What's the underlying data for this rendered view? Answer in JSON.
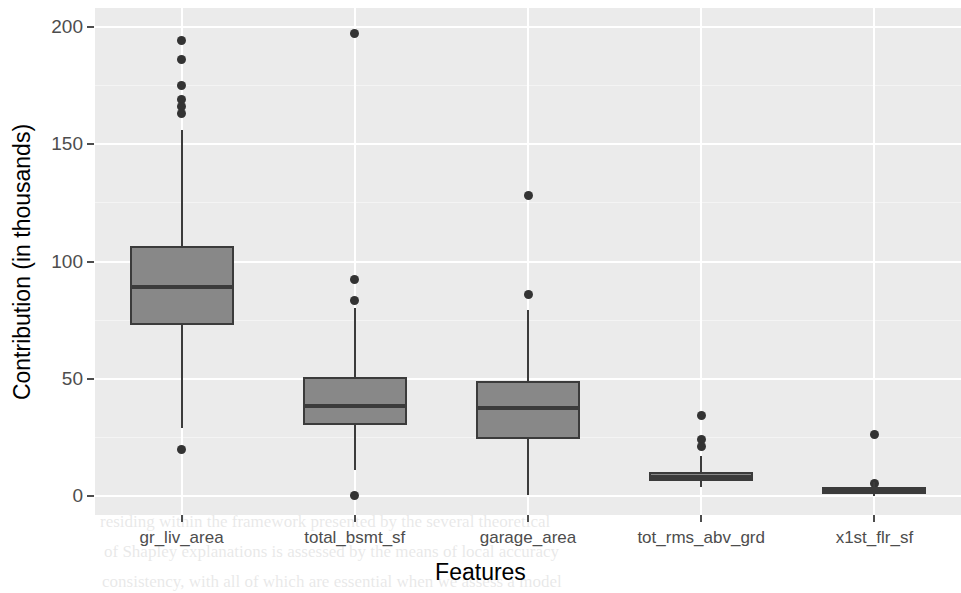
{
  "chart_data": {
    "type": "box",
    "title": "",
    "xlabel": "Features",
    "ylabel": "Contribution (in thousands)",
    "ylim": [
      -8,
      208
    ],
    "yticks": [
      0,
      50,
      100,
      150,
      200
    ],
    "ytick_labels": [
      "0",
      "50",
      "100",
      "150",
      "200"
    ],
    "yminor": [
      25,
      75,
      125,
      175
    ],
    "grid": "horizontal-and-vertical-major",
    "legend": "none",
    "categories": [
      "gr_liv_area",
      "total_bsmt_sf",
      "garage_area",
      "tot_rms_abv_grd",
      "x1st_flr_sf"
    ],
    "boxes": [
      {
        "name": "gr_liv_area",
        "whisker_low": 29,
        "q1": 73,
        "median": 89,
        "q3": 106.5,
        "whisker_high": 156,
        "outliers": [
          194,
          186,
          175,
          169,
          166,
          163,
          20
        ]
      },
      {
        "name": "total_bsmt_sf",
        "whisker_low": 11,
        "q1": 30.5,
        "median": 38.5,
        "q3": 51,
        "whisker_high": 80,
        "outliers": [
          197,
          92.5,
          83.5,
          0.5
        ]
      },
      {
        "name": "garage_area",
        "whisker_low": 0.5,
        "q1": 24.5,
        "median": 37.5,
        "q3": 49,
        "whisker_high": 79.5,
        "outliers": [
          128,
          86
        ]
      },
      {
        "name": "tot_rms_abv_grd",
        "whisker_low": 4,
        "q1": 6.5,
        "median": 8,
        "q3": 10.5,
        "whisker_high": 17,
        "outliers": [
          34.5,
          24,
          21
        ]
      },
      {
        "name": "x1st_flr_sf",
        "whisker_low": 0,
        "q1": 1,
        "median": 2.5,
        "q3": 4,
        "whisker_high": 6,
        "outliers": [
          26.5,
          5.5
        ]
      }
    ]
  },
  "axis": {
    "y_title": "Contribution (in thousands)",
    "x_title": "Features",
    "y_tick_0": "0",
    "y_tick_1": "50",
    "y_tick_2": "100",
    "y_tick_3": "150",
    "y_tick_4": "200",
    "x_tick_0": "gr_liv_area",
    "x_tick_1": "total_bsmt_sf",
    "x_tick_2": "garage_area",
    "x_tick_3": "tot_rms_abv_grd",
    "x_tick_4": "x1st_flr_sf"
  },
  "style": {
    "panel_background": "#ebebeb",
    "gridline_color": "#ffffff",
    "box_fill": "#888888",
    "box_outline": "#3b3b3b",
    "outlier_color": "#333333",
    "axis_text_color": "#4d4d4d",
    "title_color": "#000000"
  },
  "background_bleed": [
    {
      "text": "Point",
      "x": 380,
      "y": 12,
      "size": 17
    },
    {
      "text": "to examining the various  foundational models used in",
      "x": 118,
      "y": 58,
      "size": 17
    },
    {
      "text": "prediction, it is important to comprehend the mechanisms and",
      "x": 100,
      "y": 88,
      "size": 17
    },
    {
      "text": "that are  at  work  on  a  conceptual level.  In  this  chapter,  the",
      "x": 100,
      "y": 118,
      "size": 17
    },
    {
      "text": "of Explainable Machine Learning are discussed with relation",
      "x": 112,
      "y": 148,
      "size": 17
    },
    {
      "text": "the  machine  learning  models.  These  methods  permit  the",
      "x": 100,
      "y": 178,
      "size": 17
    },
    {
      "text": "of  how  individual  features  influence  a  model's  output",
      "x": 116,
      "y": 208,
      "size": 17
    },
    {
      "text": "to link the inputs to the outputs of the model to decipher",
      "x": 104,
      "y": 238,
      "size": 17
    },
    {
      "text": "of  black-box  models.  In  this  chapter,  the  SHAP  values,",
      "x": 104,
      "y": 268,
      "size": 17
    },
    {
      "text": "the calculation, and the theoretical basis will be discussed.",
      "x": 104,
      "y": 298,
      "size": 17
    },
    {
      "text": "addition,  we  will  explore  the  importance  that  SHAP  can",
      "x": 104,
      "y": 328,
      "size": 17
    },
    {
      "text": "bring to our understanding of how models are",
      "x": 108,
      "y": 358,
      "size": 17
    },
    {
      "text": "SHAP values, explanations of each feature",
      "x": 112,
      "y": 418,
      "size": 25
    },
    {
      "text": "to a model directly",
      "x": 114,
      "y": 452,
      "size": 25
    },
    {
      "text": "residing  within  the  framework  presented  by  the  several  theoretical",
      "x": 100,
      "y": 512,
      "size": 17
    },
    {
      "text": "of  Shapley  explanations  is  assessed  by  the  means  of  local  accuracy",
      "x": 104,
      "y": 542,
      "size": 17
    },
    {
      "text": "consistency, with  all  of  which  are  essential  when  we  assess  a  model",
      "x": 102,
      "y": 572,
      "size": 17
    }
  ]
}
